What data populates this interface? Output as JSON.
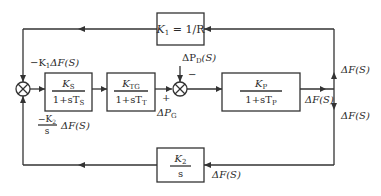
{
  "diagram": {
    "type": "control block diagram",
    "blocks": {
      "k1": {
        "name": "K",
        "sub": "1",
        "expr": " = 1/R"
      },
      "ks": {
        "num": "K",
        "num_sub": "S",
        "den": "1+sT",
        "den_sub": "S"
      },
      "ktg": {
        "num": "K",
        "num_sub": "TG",
        "den": "1+sT",
        "den_sub": "T"
      },
      "kp": {
        "num": "K",
        "num_sub": "P",
        "den": "1+sT",
        "den_sub": "P"
      },
      "k2": {
        "num": "K",
        "num_sub": "2",
        "den": "s"
      }
    },
    "labels": {
      "k1_feedback_prefix": "−K",
      "k1_feedback_sub": "1",
      "k1_feedback_suffix": "ΔF(S)",
      "k2_feedback_num": "−K",
      "k2_feedback_num_sub": "2",
      "k2_feedback_den": "s",
      "k2_feedback_suffix": "ΔF(S)",
      "load_disturbance": "ΔP",
      "load_disturbance_sub": "D",
      "load_disturbance_suffix": "(S)",
      "minus_sign": "−",
      "plus_sign": "+",
      "gen_power": "ΔP",
      "gen_power_sub": "G",
      "output": "ΔF(S)",
      "right_upper": "ΔF(S)",
      "right_lower": "ΔF(S)",
      "bottom": "ΔF(S)"
    }
  }
}
